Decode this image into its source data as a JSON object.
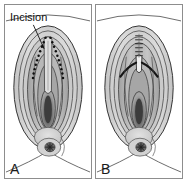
{
  "figure": {
    "type": "medical-illustration",
    "style": "grayscale line drawing",
    "width": 187,
    "height": 184,
    "background_color": "#ffffff",
    "border_color": "#8d8d8d"
  },
  "panels": [
    {
      "id": "panel-a",
      "label": "A",
      "caption_text": "Incision",
      "annotation": {
        "label": "Incision",
        "has_leader_line": true,
        "marking_style": "dotted"
      },
      "marking_style": "dotted-incision-line",
      "colors": {
        "outline": "#2b2b2b",
        "skin_light": "#d8d8d8",
        "skin_mid": "#b4b4b4",
        "skin_dark": "#8f8f8f",
        "deep_shadow": "#5a5a5a",
        "darkest": "#3a3a3a",
        "dotted_line": "#101010"
      }
    },
    {
      "id": "panel-b",
      "label": "B",
      "caption_text": "",
      "annotation": {
        "label": "",
        "has_leader_line": false,
        "marking_style": "sutures"
      },
      "marking_style": "suture-repair",
      "colors": {
        "outline": "#2b2b2b",
        "skin_light": "#d8d8d8",
        "skin_mid": "#b4b4b4",
        "skin_dark": "#8f8f8f",
        "deep_shadow": "#5a5a5a",
        "darkest": "#3a3a3a",
        "suture_line": "#101010"
      }
    }
  ]
}
